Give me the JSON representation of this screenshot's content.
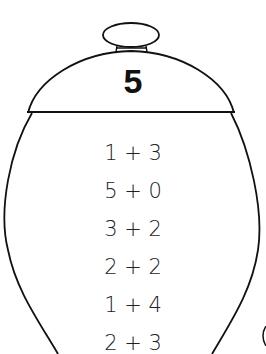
{
  "jar": {
    "lid_number": "5",
    "expressions": [
      {
        "label": "1 + 3"
      },
      {
        "label": "5 + 0"
      },
      {
        "label": "3 + 2"
      },
      {
        "label": "2 + 2"
      },
      {
        "label": "1 + 4"
      },
      {
        "label": "2 + 3"
      }
    ]
  },
  "colors": {
    "stroke": "#111111",
    "background": "#ffffff"
  }
}
